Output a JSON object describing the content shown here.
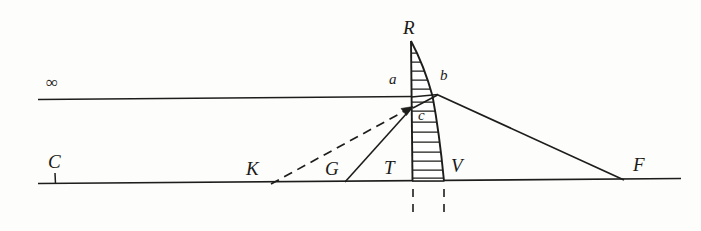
{
  "figure": {
    "kind": "optics-ray-diagram",
    "ink_color": "#1d1d1b",
    "paper_color": "#fdfdfb"
  },
  "labels": {
    "infinity": "∞",
    "center_of_curvature": "C",
    "point_k": "K",
    "point_g": "G",
    "point_t": "T",
    "point_v": "V",
    "focus_f": "F",
    "apex_r": "R",
    "point_a": "a",
    "point_b": "b",
    "point_c": "c"
  },
  "geometry": {
    "optical_axis": {
      "x1": 38,
      "y1": 183,
      "x2": 681,
      "y2": 178
    },
    "incident_ray": {
      "x1": 38,
      "y1": 99,
      "x2": 412,
      "y2": 96
    },
    "axis_tick_c": {
      "x": 55,
      "y_top": 174,
      "y_bottom": 184
    },
    "lens": {
      "apex_x": 411,
      "apex_y": 40,
      "base_left_x": 412,
      "base_right_x": 444,
      "base_y": 181,
      "hatch_count": 14
    },
    "ray_from_k_dashed": {
      "x1": 272,
      "y1": 184,
      "x2": 414,
      "y2": 107
    },
    "ray_from_g_solid": {
      "x1": 345,
      "y1": 182,
      "x2": 414,
      "y2": 107
    },
    "ray_b_to_f": {
      "x1": 437,
      "y1": 95,
      "x2": 623,
      "y2": 180
    },
    "ray_a_to_f_short": {
      "x1": 412,
      "y1": 97,
      "x2": 437,
      "y2": 95
    },
    "ray_b_to_c": {
      "x1": 437,
      "y1": 95,
      "x2": 414,
      "y2": 108
    },
    "dashed_drop_left": {
      "x": 413,
      "y1": 188,
      "y2": 215
    },
    "dashed_drop_right": {
      "x": 444,
      "y1": 188,
      "y2": 215
    }
  }
}
